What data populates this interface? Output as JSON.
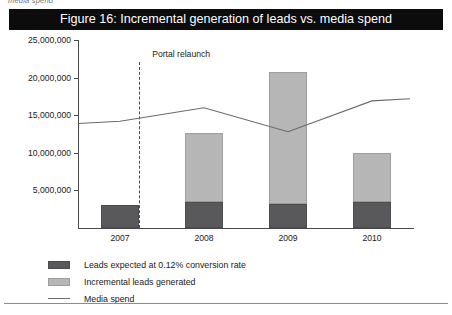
{
  "caption_fragment": "media spend",
  "title": "Figure 16: Incremental generation of leads vs. media spend",
  "annotation": {
    "label": "Portal relaunch",
    "at_x_fraction": 0.182
  },
  "legend": {
    "items": [
      {
        "key": "expected",
        "label": "Leads expected at 0.12% conversion rate",
        "color": "#59595b"
      },
      {
        "key": "incremental",
        "label": "Incremental leads generated",
        "color": "#b6b6b6"
      },
      {
        "key": "spend",
        "label": "Media spend",
        "color": "#6a6a6a"
      }
    ]
  },
  "chart_data": {
    "type": "bar",
    "title": "Figure 16: Incremental generation of leads vs. media spend",
    "xlabel": "",
    "ylabel": "",
    "categories": [
      "2007",
      "2008",
      "2009",
      "2010"
    ],
    "ylim": [
      0,
      25000000
    ],
    "yticks": [
      5000000,
      10000000,
      15000000,
      20000000,
      25000000
    ],
    "ytick_labels": [
      "5,000,000",
      "10,000,000",
      "15,000,000",
      "20,000,000",
      "25,000,000"
    ],
    "grid": false,
    "legend_position": "below",
    "stacked": true,
    "series": [
      {
        "name": "Leads expected at 0.12% conversion rate",
        "type": "bar",
        "color": "#59595b",
        "values": [
          3000000,
          3400000,
          3200000,
          3500000
        ]
      },
      {
        "name": "Incremental leads generated",
        "type": "bar",
        "color": "#b6b6b6",
        "values": [
          0,
          9200000,
          17600000,
          6500000
        ]
      },
      {
        "name": "Media spend",
        "type": "line",
        "color": "#6a6a6a",
        "values": [
          14200000,
          16000000,
          12800000,
          16900000
        ]
      }
    ],
    "annotations": [
      {
        "text": "Portal relaunch",
        "between": [
          "2007",
          "2008"
        ],
        "style": "dashed-vertical"
      }
    ]
  }
}
